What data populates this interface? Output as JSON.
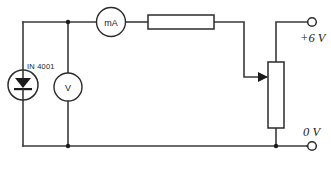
{
  "diagram": {
    "type": "electrical-schematic",
    "components": {
      "diode": {
        "symbol": "diode-in-circle",
        "label": "IN 4001",
        "orientation": "cathode-down"
      },
      "voltmeter": {
        "symbol": "meter-circle",
        "label": "V"
      },
      "milliammeter": {
        "symbol": "meter-circle",
        "label": "mA"
      },
      "resistor": {
        "symbol": "rectangle",
        "label": ""
      },
      "potentiometer": {
        "symbol": "rectangle-with-wiper",
        "label": ""
      }
    },
    "terminals": [
      {
        "name": "positive-supply",
        "label": "+6 V",
        "symbol": "open-circle"
      },
      {
        "name": "ground-supply",
        "label": "0 V",
        "symbol": "open-circle"
      }
    ],
    "colors": {
      "wire": "#3a3a3a",
      "component_outline": "#2b2b2b",
      "text": "#1b1b1b",
      "background": "#ffffff"
    }
  }
}
